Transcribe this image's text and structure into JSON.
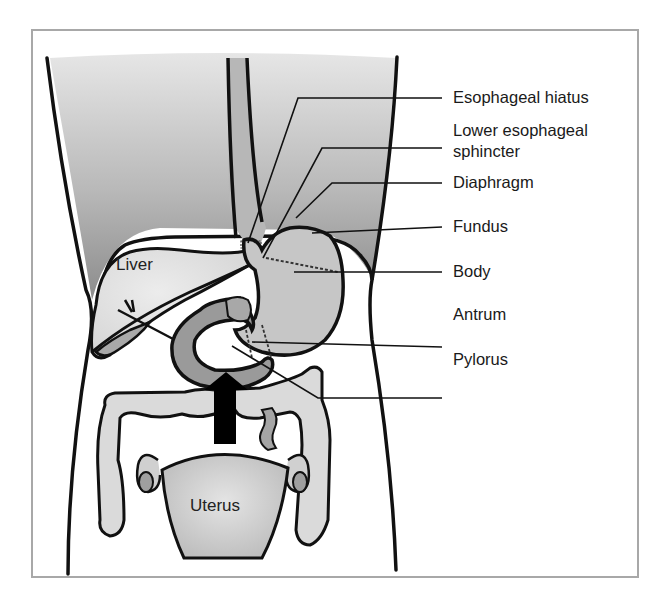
{
  "figure": {
    "type": "anatomical-diagram"
  },
  "organ_labels": {
    "liver": "Liver",
    "uterus": "Uterus"
  },
  "callouts": [
    {
      "id": "esophageal-hiatus",
      "text": "Esophageal hiatus"
    },
    {
      "id": "lower-esophageal-sphincter",
      "line1": "Lower esophageal",
      "line2": "sphincter"
    },
    {
      "id": "diaphragm",
      "text": "Diaphragm"
    },
    {
      "id": "fundus",
      "text": "Fundus"
    },
    {
      "id": "body",
      "text": "Body"
    },
    {
      "id": "antrum",
      "text": "Antrum"
    },
    {
      "id": "pylorus",
      "text": "Pylorus"
    }
  ],
  "colors": {
    "outline": "#111111",
    "thorax_gradient_top": "#e2e2e2",
    "thorax_gradient_bottom": "#8f8f8f",
    "organ_light": "#dcdcdc",
    "stomach": "#c4c4c4",
    "duodenum": "#9a9a9a",
    "uterus": "#c8c8c8",
    "frame": "#a8a8a8",
    "arrow": "#000000"
  }
}
